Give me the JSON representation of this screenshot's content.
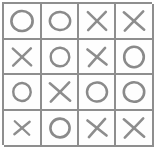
{
  "puzzle": {
    "name": "tic-tac-toe style 4x4 grid puzzle",
    "rows": 4,
    "columns": 4,
    "symbols": {
      "o": "O",
      "x": "X"
    },
    "colors": {
      "grid_line": "#8e8e8e",
      "mark": "#8a8a8a",
      "cell_background": "#fefefe",
      "page_background": "#ffffff"
    },
    "grid": [
      [
        "O",
        "O",
        "X",
        "X"
      ],
      [
        "X",
        "O",
        "X",
        "O"
      ],
      [
        "O",
        "X",
        "O",
        "O"
      ],
      [
        "X",
        "O",
        "X",
        "X"
      ]
    ],
    "cells": [
      {
        "row": 1,
        "col": 1,
        "value": "O"
      },
      {
        "row": 1,
        "col": 2,
        "value": "O"
      },
      {
        "row": 1,
        "col": 3,
        "value": "X"
      },
      {
        "row": 1,
        "col": 4,
        "value": "X"
      },
      {
        "row": 2,
        "col": 1,
        "value": "X"
      },
      {
        "row": 2,
        "col": 2,
        "value": "O"
      },
      {
        "row": 2,
        "col": 3,
        "value": "X"
      },
      {
        "row": 2,
        "col": 4,
        "value": "O"
      },
      {
        "row": 3,
        "col": 1,
        "value": "O"
      },
      {
        "row": 3,
        "col": 2,
        "value": "X"
      },
      {
        "row": 3,
        "col": 3,
        "value": "O"
      },
      {
        "row": 3,
        "col": 4,
        "value": "O"
      },
      {
        "row": 4,
        "col": 1,
        "value": "X"
      },
      {
        "row": 4,
        "col": 2,
        "value": "O"
      },
      {
        "row": 4,
        "col": 3,
        "value": "X"
      },
      {
        "row": 4,
        "col": 4,
        "value": "X"
      }
    ],
    "icon_names": {
      "o": "circle-mark-icon",
      "x": "cross-mark-icon"
    }
  }
}
